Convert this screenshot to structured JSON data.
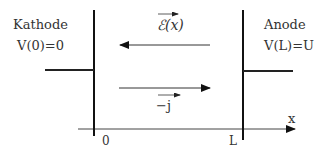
{
  "diagram": {
    "cathode": {
      "title": "Kathode",
      "potential": "V(0)=0"
    },
    "anode": {
      "title": "Anode",
      "potential": "V(L)=U"
    },
    "field_arrow": {
      "label": "ℰ(x)",
      "direction": "left"
    },
    "current_arrow": {
      "label": "−j",
      "direction": "right"
    },
    "axis": {
      "label": "x",
      "ticks": [
        "0",
        "L"
      ]
    },
    "colors": {
      "line": "#111111",
      "text": "#333333"
    }
  }
}
